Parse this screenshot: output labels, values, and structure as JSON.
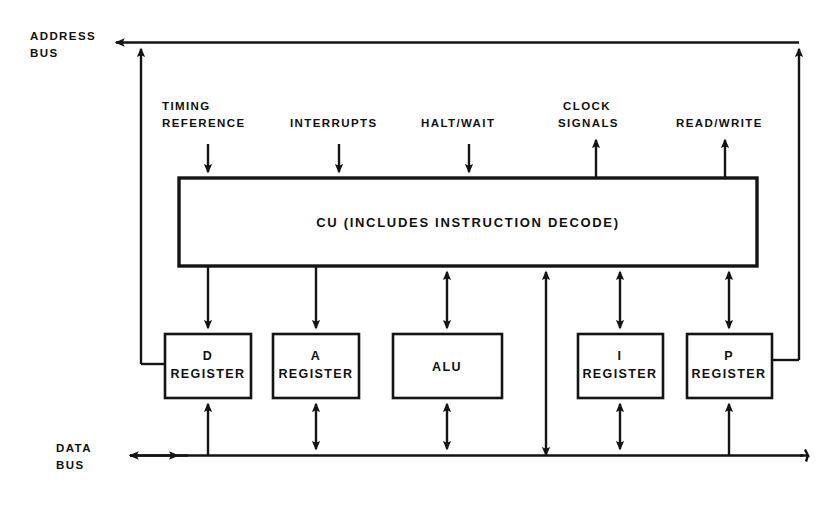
{
  "diagram": {
    "buses": [
      {
        "id": "address-bus",
        "label_line1": "ADDRESS",
        "label_line2": "BUS"
      },
      {
        "id": "data-bus",
        "label_line1": "DATA",
        "label_line2": "BUS"
      }
    ],
    "signals": [
      {
        "id": "timing-reference",
        "line1": "TIMING",
        "line2": "REFERENCE",
        "direction": "in"
      },
      {
        "id": "interrupts",
        "line1": "INTERRUPTS",
        "line2": "",
        "direction": "in"
      },
      {
        "id": "halt-wait",
        "line1": "HALT/WAIT",
        "line2": "",
        "direction": "in"
      },
      {
        "id": "clock-signals",
        "line1": "CLOCK",
        "line2": "SIGNALS",
        "direction": "out"
      },
      {
        "id": "read-write",
        "line1": "READ/WRITE",
        "line2": "",
        "direction": "out"
      }
    ],
    "control_unit": {
      "id": "cu",
      "label": "CU  (INCLUDES  INSTRUCTION  DECODE)"
    },
    "units": [
      {
        "id": "d-register",
        "line1": "D",
        "line2": "REGISTER"
      },
      {
        "id": "a-register",
        "line1": "A",
        "line2": "REGISTER"
      },
      {
        "id": "alu",
        "line1": "ALU",
        "line2": ""
      },
      {
        "id": "i-register",
        "line1": "I",
        "line2": "REGISTER"
      },
      {
        "id": "p-register",
        "line1": "P",
        "line2": "REGISTER"
      }
    ],
    "colors": {
      "ink": "#141414",
      "paper": "#ffffff"
    }
  }
}
